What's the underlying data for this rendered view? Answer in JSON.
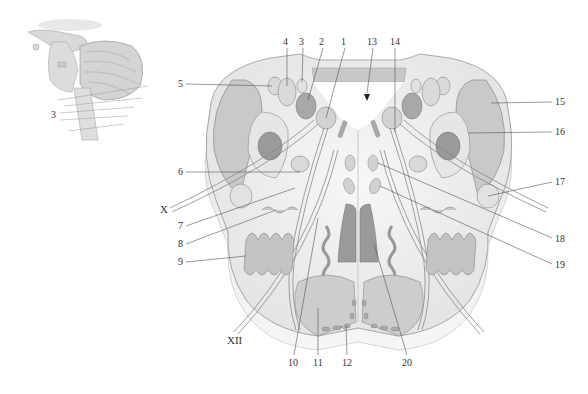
{
  "diagram": {
    "title": "",
    "colors": {
      "background": "#ffffff",
      "tissue_light": "#ececec",
      "tissue_mid": "#d6d6d6",
      "nucleus_light": "#cfcfcf",
      "nucleus_dark": "#9a9a9a",
      "outline": "#8a8a8a",
      "leader_line": "#555555",
      "label_text": "#333333"
    },
    "inset": {
      "description": "Lateral view of brainstem and cerebellum",
      "label": "3"
    },
    "labels": [
      {
        "id": "1",
        "text": "1",
        "x": 341,
        "y": 38
      },
      {
        "id": "2",
        "text": "2",
        "x": 320,
        "y": 38
      },
      {
        "id": "3",
        "text": "3",
        "x": 300,
        "y": 38
      },
      {
        "id": "4",
        "text": "4",
        "x": 283,
        "y": 38
      },
      {
        "id": "5",
        "text": "5",
        "x": 178,
        "y": 80
      },
      {
        "id": "6",
        "text": "6",
        "x": 178,
        "y": 168
      },
      {
        "id": "7",
        "text": "7",
        "x": 178,
        "y": 222
      },
      {
        "id": "8",
        "text": "8",
        "x": 178,
        "y": 240
      },
      {
        "id": "9",
        "text": "9",
        "x": 178,
        "y": 258
      },
      {
        "id": "10",
        "text": "10",
        "x": 289,
        "y": 358
      },
      {
        "id": "11",
        "text": "11",
        "x": 313,
        "y": 358
      },
      {
        "id": "12",
        "text": "12",
        "x": 342,
        "y": 358
      },
      {
        "id": "13",
        "text": "13",
        "x": 367,
        "y": 38
      },
      {
        "id": "14",
        "text": "14",
        "x": 391,
        "y": 38
      },
      {
        "id": "15",
        "text": "15",
        "x": 556,
        "y": 98
      },
      {
        "id": "16",
        "text": "16",
        "x": 556,
        "y": 128
      },
      {
        "id": "17",
        "text": "17",
        "x": 556,
        "y": 178
      },
      {
        "id": "18",
        "text": "18",
        "x": 556,
        "y": 235
      },
      {
        "id": "19",
        "text": "19",
        "x": 556,
        "y": 261
      },
      {
        "id": "20",
        "text": "20",
        "x": 402,
        "y": 358
      },
      {
        "id": "X",
        "text": "X",
        "x": 160,
        "y": 206
      },
      {
        "id": "XII",
        "text": "XII",
        "x": 228,
        "y": 336
      }
    ],
    "inset_label": {
      "text": "3",
      "x": 52,
      "y": 111
    }
  }
}
